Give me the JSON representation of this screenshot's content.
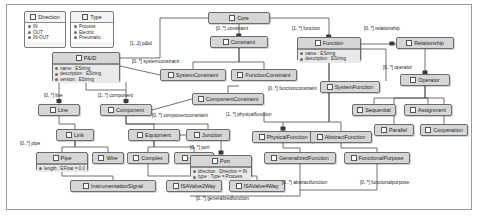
{
  "diagram": {
    "accent": "#d6d6d6",
    "border": "#6d6d6d"
  },
  "enums": [
    {
      "id": "direction",
      "name": "Direction",
      "icon": "enum-icon",
      "literals": [
        "IN",
        "OUT",
        "IN-OUT"
      ],
      "x": 24,
      "y": 11,
      "w": 42,
      "h": 37
    },
    {
      "id": "type",
      "name": "Type",
      "icon": "enum-icon",
      "literals": [
        "Process",
        "Electric",
        "Pneumatic"
      ],
      "x": 70,
      "y": 11,
      "w": 44,
      "h": 37
    }
  ],
  "classes": [
    {
      "id": "core",
      "name": "Core",
      "x": 208,
      "y": 12,
      "w": 62,
      "h": 12,
      "attrs": []
    },
    {
      "id": "constraint",
      "name": "Constraint",
      "x": 210,
      "y": 36,
      "w": 58,
      "h": 12,
      "attrs": []
    },
    {
      "id": "function",
      "name": "Function",
      "x": 297,
      "y": 37,
      "w": 64,
      "h": 24,
      "attrs": [
        "name : EString",
        "description : EString"
      ]
    },
    {
      "id": "relationship",
      "name": "Relationship",
      "x": 396,
      "y": 37,
      "w": 58,
      "h": 12,
      "attrs": []
    },
    {
      "id": "operator",
      "name": "Operator",
      "x": 400,
      "y": 74,
      "w": 50,
      "h": 12,
      "attrs": []
    },
    {
      "id": "pid",
      "name": "P&ID",
      "x": 52,
      "y": 52,
      "w": 68,
      "h": 30,
      "attrs": [
        "name : EString",
        "description : EString",
        "version : EString"
      ]
    },
    {
      "id": "systemconstraint",
      "name": "SystemConstraint",
      "x": 160,
      "y": 69,
      "w": 66,
      "h": 12,
      "attrs": []
    },
    {
      "id": "functionconstraint",
      "name": "FunctionConstraint",
      "x": 231,
      "y": 69,
      "w": 66,
      "h": 12,
      "attrs": []
    },
    {
      "id": "componentconstraint",
      "name": "ComponentConstraint",
      "x": 192,
      "y": 93,
      "w": 72,
      "h": 12,
      "attrs": []
    },
    {
      "id": "systemfunction",
      "name": "SystemFunction",
      "x": 320,
      "y": 81,
      "w": 60,
      "h": 12,
      "attrs": []
    },
    {
      "id": "sequential",
      "name": "Sequential",
      "x": 352,
      "y": 104,
      "w": 44,
      "h": 12,
      "attrs": []
    },
    {
      "id": "assignment",
      "name": "Assignment",
      "x": 404,
      "y": 104,
      "w": 48,
      "h": 12,
      "attrs": []
    },
    {
      "id": "parallel",
      "name": "Parallel",
      "x": 374,
      "y": 124,
      "w": 40,
      "h": 12,
      "attrs": []
    },
    {
      "id": "cooperation",
      "name": "Cooperation",
      "x": 420,
      "y": 124,
      "w": 48,
      "h": 12,
      "attrs": []
    },
    {
      "id": "line",
      "name": "Line",
      "x": 38,
      "y": 104,
      "w": 42,
      "h": 12,
      "attrs": []
    },
    {
      "id": "component",
      "name": "Component",
      "x": 100,
      "y": 104,
      "w": 52,
      "h": 12,
      "attrs": []
    },
    {
      "id": "link",
      "name": "Link",
      "x": 56,
      "y": 129,
      "w": 38,
      "h": 12,
      "attrs": []
    },
    {
      "id": "equipment",
      "name": "Equipment",
      "x": 128,
      "y": 129,
      "w": 52,
      "h": 12,
      "attrs": []
    },
    {
      "id": "junction",
      "name": "Junction",
      "x": 186,
      "y": 129,
      "w": 44,
      "h": 12,
      "attrs": []
    },
    {
      "id": "pipe",
      "name": "Pipe",
      "x": 36,
      "y": 152,
      "w": 52,
      "h": 19,
      "attrs": [
        "length : EFloat = 0.0"
      ]
    },
    {
      "id": "wire",
      "name": "Wire",
      "x": 92,
      "y": 152,
      "w": 32,
      "h": 12,
      "attrs": []
    },
    {
      "id": "complex",
      "name": "Complex",
      "x": 127,
      "y": 152,
      "w": 42,
      "h": 12,
      "attrs": []
    },
    {
      "id": "simple",
      "name": "Simple",
      "x": 174,
      "y": 152,
      "w": 40,
      "h": 12,
      "attrs": []
    },
    {
      "id": "port",
      "name": "Port",
      "x": 190,
      "y": 155,
      "w": 62,
      "h": 22,
      "attrs": [
        "direction : Direction = IN",
        "type : Type = Process"
      ]
    },
    {
      "id": "physicalfunction",
      "name": "PhysicalFunction",
      "x": 252,
      "y": 131,
      "w": 62,
      "h": 12,
      "attrs": []
    },
    {
      "id": "abstractfunction",
      "name": "AbstractFunction",
      "x": 310,
      "y": 131,
      "w": 62,
      "h": 12,
      "attrs": []
    },
    {
      "id": "generalizedfunction",
      "name": "GeneralizedFunction",
      "x": 264,
      "y": 152,
      "w": 72,
      "h": 12,
      "attrs": []
    },
    {
      "id": "functionalpurpose",
      "name": "FunctionalPurpose",
      "x": 344,
      "y": 152,
      "w": 66,
      "h": 12,
      "attrs": []
    },
    {
      "id": "instrumentationsignal",
      "name": "InstrumentationSignal",
      "x": 70,
      "y": 180,
      "w": 86,
      "h": 12,
      "attrs": []
    },
    {
      "id": "isavalve2way",
      "name": "ISAValve2Way",
      "x": 166,
      "y": 180,
      "w": 56,
      "h": 12,
      "attrs": []
    },
    {
      "id": "isavalve4way",
      "name": "ISAValve4Way",
      "x": 229,
      "y": 180,
      "w": 56,
      "h": 12,
      "attrs": []
    }
  ],
  "edge_labels": [
    {
      "id": "pid-core",
      "text": "[1..1] p&id",
      "x": 130,
      "y": 41
    },
    {
      "id": "core-constraint",
      "text": "[0..*] constraint",
      "x": 216,
      "y": 26
    },
    {
      "id": "core-function",
      "text": "[1..*] function",
      "x": 292,
      "y": 26
    },
    {
      "id": "core-relationship",
      "text": "[0..*] relationship",
      "x": 364,
      "y": 26
    },
    {
      "id": "rel-operator",
      "text": "[0..*] operator",
      "x": 383,
      "y": 65
    },
    {
      "id": "systemconstraint",
      "text": "[0..*] systemconstraint",
      "x": 132,
      "y": 59
    },
    {
      "id": "functionconstraint",
      "text": "[0..*] functionconstraint",
      "x": 268,
      "y": 86
    },
    {
      "id": "componentconstraint",
      "text": "[0..*] componentconstraint",
      "x": 152,
      "y": 113
    },
    {
      "id": "physicalfunction",
      "text": "[1..*] physicalfunction",
      "x": 226,
      "y": 112
    },
    {
      "id": "line",
      "text": "[0..*] line",
      "x": 44,
      "y": 93
    },
    {
      "id": "component",
      "text": "[1..*] component",
      "x": 98,
      "y": 93
    },
    {
      "id": "pipe",
      "text": "[0..*] pipe",
      "x": 20,
      "y": 141
    },
    {
      "id": "port",
      "text": "[0..*] port",
      "x": 190,
      "y": 145
    },
    {
      "id": "abstractfunction",
      "text": "[0..*] abstractfunction",
      "x": 282,
      "y": 180
    },
    {
      "id": "functionalpurpose",
      "text": "[0..*] functionalpurpose",
      "x": 360,
      "y": 180
    },
    {
      "id": "generalizedfunction",
      "text": "[0..*] generalizedfunction",
      "x": 196,
      "y": 196
    }
  ]
}
